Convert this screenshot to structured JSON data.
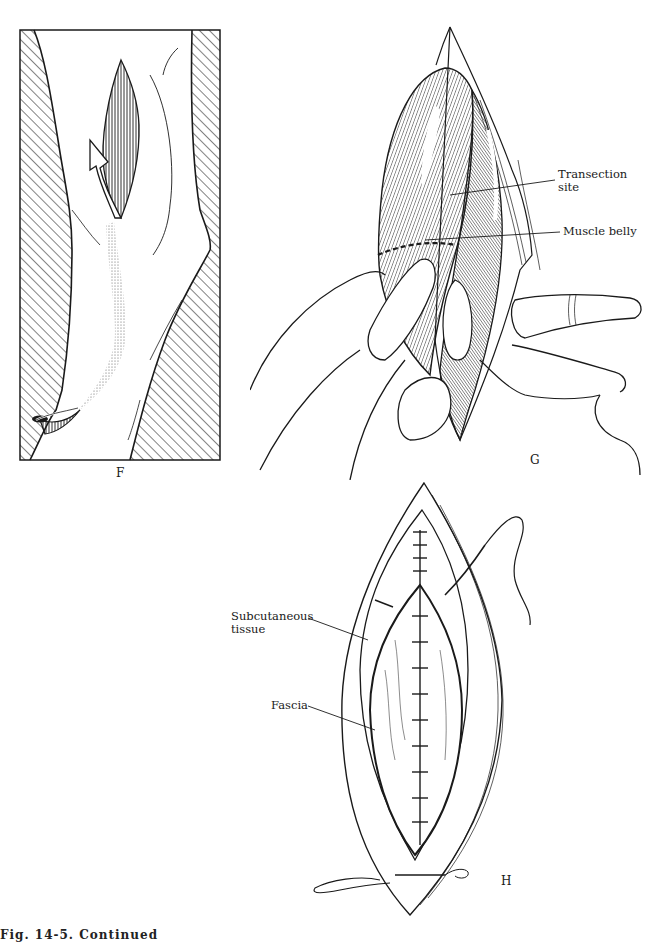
{
  "figure": {
    "panels": [
      {
        "id": "F",
        "letter": "F",
        "description": "Limb with incision and curved arrow indicating tendon transfer route, hatched background borders"
      },
      {
        "id": "G",
        "letter": "G",
        "description": "Hands retracting exposed muscle with dashed transection line",
        "labels": [
          {
            "text_line1": "Transection",
            "text_line2": "site"
          },
          {
            "text_line1": "Muscle belly"
          }
        ]
      },
      {
        "id": "H",
        "letter": "H",
        "description": "Elliptical wound closure showing sutured fascia and subcutaneous tissue",
        "labels": [
          {
            "text_line1": "Subcutaneous",
            "text_line2": "tissue"
          },
          {
            "text_line1": "Fascia"
          }
        ]
      }
    ],
    "caption_partial": "Fig. 14-5. Continued"
  },
  "colors": {
    "ink": "#1a1a1a",
    "paper": "#ffffff",
    "stipple": "#777777"
  }
}
